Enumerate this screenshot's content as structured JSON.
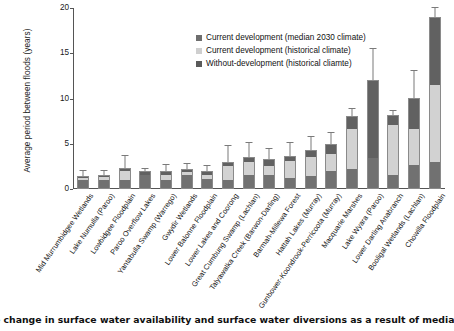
{
  "chart_data": {
    "type": "bar",
    "title": "",
    "xlabel": "",
    "ylabel": "Average period between floods (years)",
    "ylim": [
      0,
      20
    ],
    "yticks": [
      0,
      5,
      10,
      15,
      20
    ],
    "grid": false,
    "legend_position": "top-left-inside",
    "stacked": true,
    "categories": [
      "Mid Murrumbidgee Wetlands",
      "Lake Numulla (Paroo)",
      "Lowbidgee Floodplain",
      "Paroo Overflow Lakes",
      "Yantabulla Swamp (Warrego)",
      "Gwydir Wetlands",
      "Lower Balonne Floodplain",
      "Lower Lakes and Coorong",
      "Great Cumbung Swamp (Lachlan)",
      "Talyawalka Creek (Barwon-Darling)",
      "Barmah-Millewa Forest",
      "Hattah Lakes (Murray)",
      "Gunbower-Koondrook-Perricoota (Murray)",
      "Macquarie Marshes",
      "Lake Wyara (Paroo)",
      "Lower Darling Anabranch",
      "Booligal Wetlands (Lachlan)",
      "Chowilla Floodplain"
    ],
    "series": [
      {
        "name": "Without-development (historical cliamte)",
        "color": "#717171",
        "values": [
          1.0,
          1.0,
          1.0,
          1.6,
          1.0,
          1.5,
          1.1,
          1.0,
          1.5,
          1.5,
          1.2,
          1.4,
          2.0,
          2.2,
          3.4,
          1.6,
          2.6,
          3.0
        ]
      },
      {
        "name": "Current development (historical climate)",
        "color": "#d2d2d2",
        "values": [
          0.2,
          0.3,
          1.0,
          0.0,
          0.6,
          0.4,
          0.5,
          1.5,
          1.5,
          1.0,
          1.9,
          2.1,
          1.9,
          4.4,
          0.0,
          5.5,
          4.0,
          8.5
        ]
      },
      {
        "name": "Current development (median 2030 climate)",
        "color": "#616161",
        "values": [
          0.2,
          0.2,
          0.3,
          0.4,
          0.4,
          0.3,
          0.4,
          0.5,
          0.5,
          0.8,
          0.6,
          0.8,
          1.1,
          1.5,
          8.6,
          1.1,
          3.5,
          7.5
        ]
      }
    ],
    "totals": [
      1.4,
      1.5,
      2.3,
      2.0,
      2.0,
      2.2,
      2.0,
      3.0,
      3.5,
      3.3,
      3.7,
      4.3,
      5.0,
      8.1,
      12.0,
      8.2,
      10.1,
      19.0
    ],
    "error_bar_tops": [
      2.0,
      2.0,
      3.6,
      2.2,
      2.6,
      2.8,
      2.5,
      4.7,
      5.1,
      4.4,
      5.1,
      5.7,
      6.2,
      8.8,
      15.5,
      8.6,
      13.0,
      20.0
    ]
  },
  "legend": {
    "items": [
      {
        "label": "Current development (median 2030 climate)",
        "swatch": "sw-dark"
      },
      {
        "label": "Current development (historical climate)",
        "swatch": "sw-light"
      },
      {
        "label": "Without-development (historical cliamte)",
        "swatch": "sw-darker"
      }
    ]
  },
  "caption": {
    "text": "e change in surface water availability and surface water diversions as a result of median clim"
  }
}
